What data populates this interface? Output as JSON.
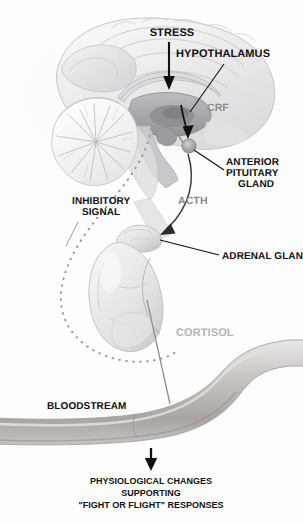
{
  "figure": {
    "background_color": "#fdfdfd"
  },
  "colors": {
    "label_black": "#111111",
    "label_gray": "#8a8a8a",
    "label_faint_gray": "#b4b4b4",
    "brain_tint": "#d8d8da",
    "vessel_tint": "#b9b6b4",
    "dotted_signal": "#9a9a9a"
  },
  "labels": {
    "stress": "STRESS",
    "hypothalamus": "HYPOTHALAMUS",
    "crf": "CRF",
    "anterior_pituitary_gland": {
      "line1": "ANTERIOR",
      "line2": "PITUITARY",
      "line3": "GLAND"
    },
    "acth": "ACTH",
    "inhibitory_signal": {
      "line1": "INHIBITORY",
      "line2": "SIGNAL"
    },
    "adrenal_gland": "ADRENAL GLAND",
    "cortisol": "CORTISOL",
    "bloodstream": "BLOODSTREAM"
  },
  "caption": {
    "line1": "PHYSIOLOGICAL CHANGES",
    "line2": "SUPPORTING",
    "line3": "\"FIGHT OR FLIGHT\" RESPONSES"
  },
  "anatomy": {
    "structures": [
      "cerebrum",
      "cerebellum",
      "brainstem",
      "corpus callosum",
      "hypothalamus",
      "anterior pituitary gland",
      "adrenal gland",
      "kidney",
      "blood vessel"
    ]
  },
  "pathways": [
    {
      "name": "stress-input",
      "from": "STRESS",
      "to": "hypothalamus",
      "style": "solid-arrow"
    },
    {
      "name": "crf-release",
      "from": "hypothalamus",
      "to": "anterior pituitary gland",
      "label": "CRF",
      "style": "solid-arrow"
    },
    {
      "name": "acth-release",
      "from": "anterior pituitary gland",
      "to": "adrenal gland",
      "label": "ACTH",
      "style": "solid-arrow"
    },
    {
      "name": "cortisol-release",
      "from": "adrenal gland",
      "to": "bloodstream",
      "label": "CORTISOL",
      "style": "solid-line"
    },
    {
      "name": "negative-feedback",
      "from": "adrenal gland",
      "to": "hypothalamus",
      "label": "INHIBITORY SIGNAL",
      "style": "dotted-curve"
    },
    {
      "name": "outcome",
      "from": "bloodstream",
      "to": "physiological changes",
      "style": "solid-arrow"
    }
  ]
}
